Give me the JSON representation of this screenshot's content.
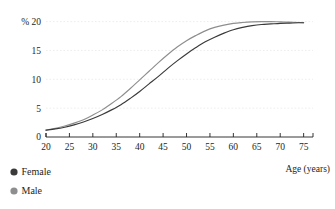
{
  "chart_data": {
    "type": "line",
    "title": "",
    "xlabel": "Age (years)",
    "ylabel": "% 20",
    "y_unit_prefix": "%",
    "xlim": [
      20,
      77
    ],
    "ylim": [
      0,
      20.8
    ],
    "x_ticks": [
      20,
      25,
      30,
      35,
      40,
      45,
      50,
      55,
      60,
      65,
      70,
      75
    ],
    "x_tick_labels": [
      "20",
      "25",
      "30",
      "35",
      "40",
      "45",
      "50",
      "55",
      "60",
      "65",
      "70",
      "75"
    ],
    "y_ticks": [
      0,
      5,
      10,
      15,
      20
    ],
    "y_tick_labels": [
      "0",
      "5",
      "10",
      "15",
      "% 20"
    ],
    "grid": true,
    "grid_axis": "y",
    "grid_color": "#e8e4e4",
    "legend_position": "below-left",
    "x": [
      20,
      22,
      24,
      26,
      28,
      30,
      32,
      34,
      36,
      38,
      40,
      42,
      44,
      46,
      48,
      50,
      52,
      54,
      56,
      58,
      60,
      62,
      64,
      66,
      68,
      70,
      72,
      74,
      75
    ],
    "series": [
      {
        "name": "Female",
        "color": "#3a3a3a",
        "marker": "circle",
        "values": [
          1.2,
          1.4,
          1.7,
          2.1,
          2.6,
          3.2,
          3.9,
          4.7,
          5.6,
          6.7,
          7.9,
          9.2,
          10.5,
          11.9,
          13.2,
          14.4,
          15.5,
          16.5,
          17.3,
          18.0,
          18.6,
          19.0,
          19.3,
          19.5,
          19.6,
          19.7,
          19.75,
          19.8,
          19.8
        ]
      },
      {
        "name": "Male",
        "color": "#8e8e8e",
        "marker": "circle",
        "values": [
          1.2,
          1.5,
          1.9,
          2.4,
          3.0,
          3.8,
          4.7,
          5.8,
          7.0,
          8.4,
          9.9,
          11.4,
          12.9,
          14.3,
          15.6,
          16.7,
          17.6,
          18.4,
          19.0,
          19.4,
          19.7,
          19.85,
          19.95,
          20.0,
          20.0,
          19.95,
          19.9,
          19.85,
          19.8
        ]
      }
    ]
  },
  "legend": {
    "items": [
      {
        "label": "Female",
        "color": "#3a3a3a"
      },
      {
        "label": "Male",
        "color": "#8e8e8e"
      }
    ]
  },
  "axes": {
    "axis_color": "#231f20",
    "x_axis_title": "Age (years)"
  }
}
